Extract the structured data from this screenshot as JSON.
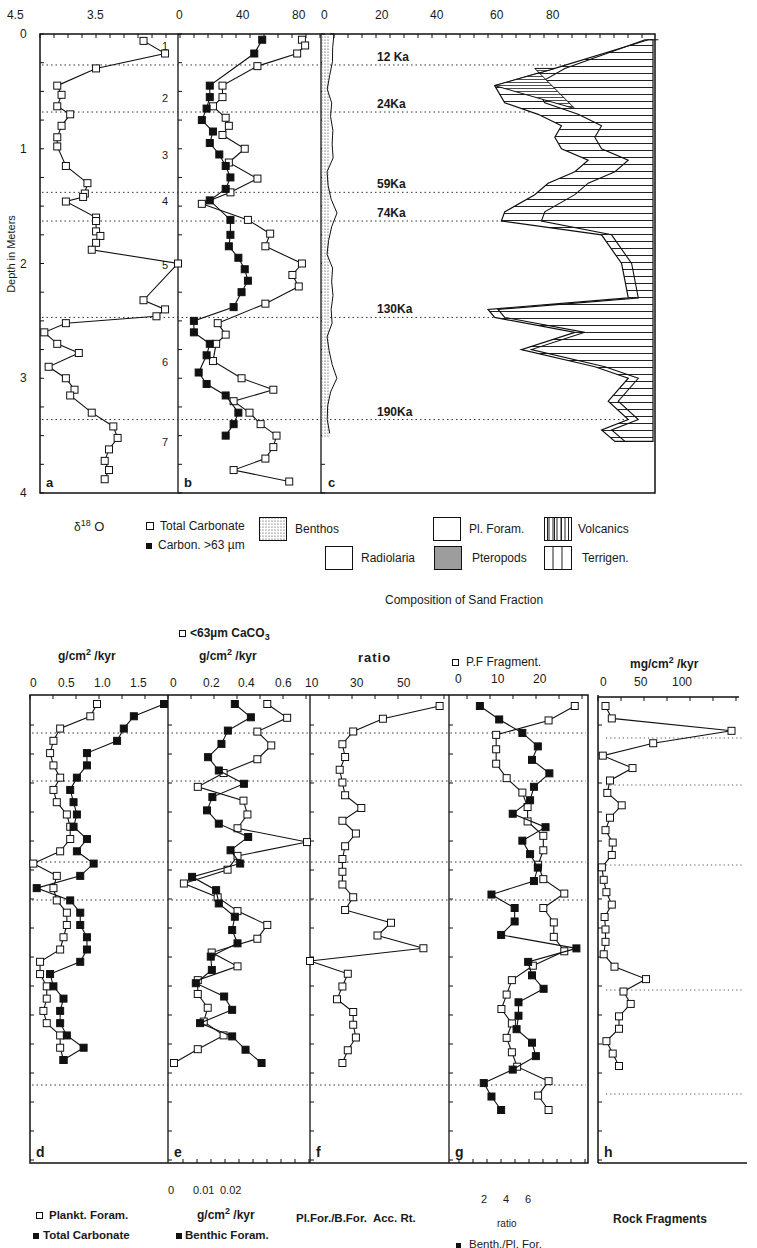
{
  "figure": {
    "depth_axis_label": "Depth in Meters",
    "depth_ticks": [
      "0",
      "1",
      "2",
      "3",
      "4"
    ],
    "top_panels": {
      "a": {
        "letter": "a",
        "axis_ticks": [
          "4.5",
          "3.5"
        ],
        "legend": "δ18O",
        "legend_main": "δ",
        "legend_sup": "18",
        "legend_tail": " O"
      },
      "b": {
        "letter": "b",
        "axis_ticks": [
          "0",
          "40",
          "80"
        ],
        "legend_open": "Total Carbonate",
        "legend_filled": "Carbon. >63 µm"
      },
      "c": {
        "letter": "c",
        "axis_ticks": [
          "0",
          "20",
          "40",
          "60",
          "80"
        ],
        "age_labels": [
          "12 Ka",
          "24Ka",
          "59Ka",
          "74Ka",
          "130Ka",
          "190Ka"
        ],
        "legend_items": [
          "Benthos",
          "Pl. Foram.",
          "Volcanics",
          "Radiolaria",
          "Pteropods",
          "Terrigen."
        ],
        "legend_title": "Composition of Sand Fraction"
      },
      "stage_numbers": [
        "1",
        "2",
        "3",
        "4",
        "5",
        "6",
        "7"
      ]
    },
    "bottom_panels": {
      "d": {
        "letter": "d",
        "unit_label": "g/cm2 /kyr",
        "unit_main": "g/cm",
        "unit_sup": "2",
        "unit_tail": " /kyr",
        "axis_ticks": [
          "0",
          "0.5",
          "1.0",
          "1.5"
        ],
        "legend_open": "Plankt. Foram.",
        "legend_filled": "Total Carbonate"
      },
      "e": {
        "letter": "e",
        "series_label": "<63µm  CaCO3",
        "series_main": "<63µm  CaCO",
        "series_sub": "3",
        "unit_main": "g/cm",
        "unit_sup": "2",
        "unit_tail": " /kyr",
        "axis_ticks": [
          "0",
          "0.2",
          "0.4",
          "0.6"
        ],
        "bottom_ticks": [
          "0",
          "0.01",
          "0.02"
        ],
        "bottom_unit_main": "g/cm",
        "bottom_unit_sup": "2",
        "bottom_unit_tail": " /kyr",
        "legend_filled": "Benthic Foram."
      },
      "f": {
        "letter": "f",
        "unit_label": "ratio",
        "axis_ticks": [
          "10",
          "30",
          "50"
        ],
        "legend": "Pl.For./B.For.  Acc. Rt."
      },
      "g": {
        "letter": "g",
        "series_label": "P.F  Fragment.",
        "axis_ticks": [
          "0",
          "10",
          "20"
        ],
        "bottom_ticks": [
          "2",
          "4",
          "6"
        ],
        "bottom_label": "ratio",
        "legend_filled": "Benth./Pl. For."
      },
      "h": {
        "letter": "h",
        "unit_main": "mg/cm",
        "unit_sup": "2",
        "unit_tail": " /kyr",
        "axis_ticks": [
          "0",
          "50",
          "100"
        ],
        "legend": "Rock Fragments"
      }
    }
  },
  "chart_data": [
    {
      "type": "line",
      "id": "a",
      "title": "δ18O",
      "xlabel": "δ18O",
      "ylabel": "Depth in Meters",
      "xlim": [
        4.5,
        2.9
      ],
      "ylim": [
        4,
        0
      ],
      "series": [
        {
          "name": "δ18O",
          "marker": "open-square",
          "depth": [
            0.06,
            0.17,
            0.3,
            0.45,
            0.53,
            0.63,
            0.7,
            0.8,
            0.9,
            0.98,
            1.15,
            1.3,
            1.39,
            1.42,
            1.46,
            1.6,
            1.63,
            1.72,
            1.76,
            1.82,
            1.88,
            2.0,
            2.32,
            2.4,
            2.46,
            2.52,
            2.6,
            2.7,
            2.78,
            2.9,
            3.0,
            3.1,
            3.15,
            3.3,
            3.42,
            3.52,
            3.62,
            3.72,
            3.8,
            3.88
          ],
          "values": [
            3.3,
            3.05,
            3.85,
            4.3,
            4.25,
            4.3,
            4.15,
            4.25,
            4.3,
            4.3,
            4.2,
            3.95,
            3.98,
            4.0,
            4.2,
            3.85,
            3.85,
            3.85,
            3.8,
            3.85,
            3.9,
            2.9,
            3.3,
            3.05,
            3.15,
            4.2,
            4.45,
            4.3,
            4.05,
            4.4,
            4.2,
            4.1,
            4.15,
            3.9,
            3.65,
            3.6,
            3.7,
            3.75,
            3.7,
            3.75
          ]
        }
      ]
    },
    {
      "type": "line",
      "id": "b",
      "xlabel": "%",
      "ylim": [
        4,
        0
      ],
      "xlim": [
        0,
        90
      ],
      "series": [
        {
          "name": "Total Carbonate",
          "marker": "open-square",
          "depth": [
            0.05,
            0.1,
            0.17,
            0.28,
            0.45,
            0.55,
            0.63,
            0.73,
            0.8,
            0.88,
            1.0,
            1.12,
            1.26,
            1.38,
            1.48,
            1.62,
            1.74,
            1.85,
            2.0,
            2.1,
            2.2,
            2.35,
            2.52,
            2.62,
            2.7,
            2.85,
            3.0,
            3.1,
            3.2,
            3.3,
            3.4,
            3.5,
            3.6,
            3.7,
            3.8,
            3.9
          ],
          "values": [
            78,
            80,
            75,
            50,
            28,
            28,
            22,
            30,
            32,
            28,
            42,
            32,
            50,
            33,
            15,
            44,
            58,
            55,
            78,
            72,
            76,
            55,
            25,
            30,
            24,
            22,
            40,
            60,
            35,
            45,
            52,
            62,
            60,
            55,
            35,
            70
          ]
        },
        {
          "name": "Carbon. >63 µm",
          "marker": "filled-square",
          "depth": [
            0.05,
            0.17,
            0.45,
            0.55,
            0.65,
            0.75,
            0.85,
            0.95,
            1.05,
            1.15,
            1.25,
            1.35,
            1.45,
            1.62,
            1.75,
            1.85,
            1.95,
            2.05,
            2.15,
            2.25,
            2.38,
            2.5,
            2.6,
            2.7,
            2.8,
            2.95,
            3.05,
            3.15,
            3.3,
            3.4,
            3.5
          ],
          "values": [
            53,
            48,
            20,
            20,
            18,
            15,
            22,
            20,
            26,
            30,
            33,
            30,
            20,
            33,
            33,
            32,
            38,
            42,
            44,
            40,
            35,
            10,
            10,
            20,
            18,
            13,
            18,
            30,
            38,
            35,
            30
          ]
        }
      ]
    },
    {
      "type": "area",
      "id": "c",
      "title": "Composition of Sand Fraction",
      "xlim": [
        0,
        100
      ],
      "ylim": [
        4,
        0
      ],
      "series_names": [
        "Benthos",
        "Radiolaria",
        "Pl. Foram.",
        "Pteropods",
        "Volcanics",
        "Terrigen."
      ],
      "age_markers": [
        {
          "label": "12 Ka",
          "depth": 0.27
        },
        {
          "label": "24Ka",
          "depth": 0.68
        },
        {
          "label": "59Ka",
          "depth": 1.38
        },
        {
          "label": "74Ka",
          "depth": 1.63
        },
        {
          "label": "130Ka",
          "depth": 2.47
        },
        {
          "label": "190Ka",
          "depth": 3.36
        }
      ],
      "pl_foram_boundary": {
        "depth": [
          0.05,
          0.3,
          0.45,
          0.6,
          0.7,
          0.8,
          0.9,
          1.0,
          1.1,
          1.2,
          1.3,
          1.4,
          1.55,
          1.63,
          1.75,
          2.0,
          2.3,
          2.4,
          2.47,
          2.6,
          2.75,
          2.9,
          3.0,
          3.2,
          3.36,
          3.45,
          3.55
        ],
        "values": [
          98,
          70,
          52,
          55,
          65,
          72,
          70,
          72,
          80,
          76,
          68,
          64,
          55,
          54,
          84,
          90,
          92,
          50,
          52,
          76,
          60,
          82,
          92,
          86,
          92,
          84,
          88
        ]
      }
    },
    {
      "type": "line",
      "id": "d",
      "xlabel": "g/cm2 /kyr",
      "xlim": [
        0,
        2.0
      ],
      "series": [
        {
          "name": "Plankt. Foram.",
          "marker": "open-square",
          "values": [
            1.0,
            0.9,
            0.45,
            0.35,
            0.3,
            0.35,
            0.45,
            0.35,
            0.4,
            0.55,
            0.6,
            0.6,
            0.45,
            0.05,
            0.4,
            0.35,
            0.4,
            0.55,
            0.55,
            0.5,
            0.45,
            0.15,
            0.15,
            0.25,
            0.25,
            0.2,
            0.25,
            0.45,
            0.45,
            0.5
          ]
        },
        {
          "name": "Total Carbonate",
          "marker": "filled-square",
          "values": [
            2.0,
            1.55,
            1.4,
            1.3,
            0.85,
            0.85,
            0.7,
            0.6,
            0.65,
            0.7,
            0.65,
            0.85,
            0.7,
            0.95,
            0.75,
            0.1,
            0.6,
            0.75,
            0.75,
            0.85,
            0.85,
            0.75,
            0.3,
            0.35,
            0.5,
            0.45,
            0.45,
            0.55,
            0.8,
            0.5
          ]
        }
      ]
    },
    {
      "type": "line",
      "id": "e",
      "xlabel": "g/cm2 /kyr",
      "xlim": [
        0,
        0.7
      ],
      "series": [
        {
          "name": "<63µm CaCO3",
          "marker": "open-square",
          "values": [
            0.5,
            0.6,
            0.45,
            0.52,
            0.45,
            0.28,
            0.15,
            0.38,
            0.4,
            0.35,
            0.7,
            0.35,
            0.3,
            0.08,
            0.25,
            0.35,
            0.5,
            0.45,
            0.22,
            0.35,
            0.15,
            0.15,
            0.2,
            0.18,
            0.28,
            0.15,
            0.03
          ]
        },
        {
          "name": "Benthic Foram.",
          "marker": "filled-square",
          "values": [
            0.0125,
            0.0155,
            0.0112,
            0.01,
            0.0075,
            0.0095,
            0.0142,
            0.0083,
            0.0073,
            0.0095,
            0.015,
            0.0117,
            0.0135,
            0.0045,
            0.009,
            0.0095,
            0.0125,
            0.012,
            0.013,
            0.008,
            0.0082,
            0.0052,
            0.0105,
            0.012,
            0.006,
            0.012,
            0.0145,
            0.0175
          ]
        }
      ]
    },
    {
      "type": "line",
      "id": "f",
      "xlabel": "ratio",
      "title": "Pl.For./B.For. Acc. Rt.",
      "xlim": [
        10,
        60
      ],
      "series": [
        {
          "name": "Pl.For./B.For. Acc. Rt.",
          "marker": "open-square",
          "values": [
            58,
            37,
            26,
            22,
            23,
            21,
            22,
            23,
            29,
            22,
            27,
            23,
            22,
            22,
            22,
            26,
            23,
            40,
            35,
            52,
            10,
            24,
            22,
            20,
            26,
            26,
            27,
            24,
            22
          ]
        }
      ]
    },
    {
      "type": "line",
      "id": "g",
      "xlim": [
        0,
        25
      ],
      "series": [
        {
          "name": "P.F Fragment.",
          "marker": "open-square",
          "values": [
            24,
            19,
            9,
            9,
            9,
            11,
            14,
            15,
            15,
            18,
            18,
            17,
            18,
            22,
            18,
            20,
            20,
            22,
            16,
            12,
            11,
            10,
            12,
            11,
            12,
            13,
            19,
            17,
            19
          ]
        },
        {
          "name": "Benth./Pl. For.",
          "marker": "filled-square",
          "bottom_xlim": [
            0,
            7
          ],
          "values": [
            1.6,
            2.6,
            3.8,
            4.6,
            4.3,
            5.2,
            4.4,
            4.2,
            3.3,
            5.0,
            3.8,
            4.2,
            4.6,
            4.4,
            2.2,
            3.4,
            3.4,
            2.7,
            6.6,
            4.1,
            4.3,
            4.9,
            3.6,
            3.6,
            3.5,
            4.3,
            4.5,
            3.3,
            1.8,
            2.2,
            2.7
          ]
        }
      ]
    },
    {
      "type": "line",
      "id": "h",
      "xlabel": "mg/cm2 /kyr",
      "title": "Rock Fragments",
      "xlim": [
        0,
        150
      ],
      "series": [
        {
          "name": "Rock Fragments",
          "marker": "open-square",
          "values": [
            5,
            12,
            145,
            58,
            2,
            35,
            10,
            7,
            23,
            10,
            5,
            13,
            12,
            1,
            3,
            6,
            12,
            4,
            5,
            5,
            3,
            15,
            50,
            25,
            33,
            20,
            20,
            6,
            13,
            20
          ]
        }
      ]
    }
  ]
}
